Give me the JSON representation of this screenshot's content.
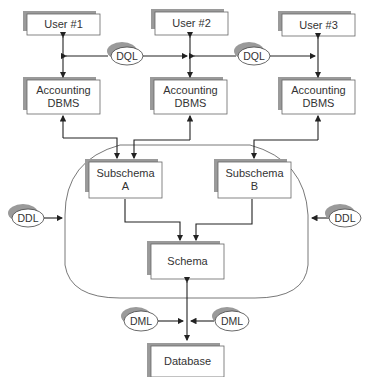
{
  "diagram": {
    "colors": {
      "line": "#222222",
      "box_fill": "#ffffff",
      "box_shadow": "#9a9a9a",
      "boundary": "#555555"
    },
    "users": [
      {
        "label": "User #1"
      },
      {
        "label": "User #2"
      },
      {
        "label": "User #3"
      }
    ],
    "dbms": [
      {
        "label": "Accounting DBMS"
      },
      {
        "label": "Accounting DBMS"
      },
      {
        "label": "Accounting DBMS"
      }
    ],
    "subschemas": [
      {
        "label": "Subschema A"
      },
      {
        "label": "Subschema B"
      }
    ],
    "schema": {
      "label": "Schema"
    },
    "database": {
      "label": "Database"
    },
    "languages": {
      "dql_left": "DQL",
      "dql_right": "DQL",
      "ddl_left": "DDL",
      "ddl_right": "DDL",
      "dml_left": "DML",
      "dml_right": "DML"
    }
  }
}
